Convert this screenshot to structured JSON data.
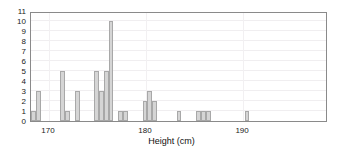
{
  "chart_data": {
    "type": "bar",
    "title": "",
    "subtitle": "",
    "xlabel": "Height (cm)",
    "ylabel": "",
    "xlim": [
      168.15,
      198.75
    ],
    "ylim": [
      0,
      11
    ],
    "grid": true,
    "legend": null,
    "bin_width": 0.5,
    "y_ticks": [
      0,
      1,
      2,
      3,
      4,
      5,
      6,
      7,
      8,
      9,
      10,
      11
    ],
    "y_tick_labels": [
      "0",
      "1",
      "2",
      "3",
      "4",
      "5",
      "6",
      "7",
      "8",
      "9",
      "10",
      "11"
    ],
    "x_ticks": [
      170,
      180,
      190
    ],
    "x_tick_labels": [
      "170",
      "180",
      "190"
    ],
    "bin_starts": [
      168.15,
      168.65,
      169.15,
      169.65,
      170.15,
      170.65,
      171.15,
      171.65,
      172.15,
      172.65,
      173.15,
      173.65,
      174.15,
      174.65,
      175.15,
      175.65,
      176.15,
      176.65,
      177.15,
      177.65,
      178.15,
      178.65,
      179.15,
      179.65,
      180.15,
      180.65,
      181.15,
      181.65,
      182.15,
      182.65,
      183.15,
      183.65,
      184.15,
      184.65,
      185.15,
      185.65,
      186.15,
      186.65,
      187.15,
      187.65,
      188.15,
      188.65,
      189.15,
      189.65,
      190.15,
      190.65,
      191.15,
      191.65,
      192.15,
      192.65,
      193.15,
      193.65,
      194.15,
      194.65,
      195.15,
      195.65,
      196.15,
      196.65,
      197.15,
      197.65,
      198.15
    ],
    "categories": [
      "168.2",
      "168.7",
      "169.2",
      "169.7",
      "170.2",
      "170.7",
      "171.2",
      "171.7",
      "172.2",
      "172.7",
      "173.2",
      "173.7",
      "174.2",
      "174.7",
      "175.2",
      "175.7",
      "176.2",
      "176.7",
      "177.2",
      "177.7",
      "178.2",
      "178.7",
      "179.2",
      "179.7",
      "180.2",
      "180.7",
      "181.2",
      "181.7",
      "182.2",
      "182.7",
      "183.2",
      "183.7",
      "184.2",
      "184.7",
      "185.2",
      "185.7",
      "186.2",
      "186.7",
      "187.2",
      "187.7",
      "188.2",
      "188.7",
      "189.2",
      "189.7",
      "190.2",
      "190.7",
      "191.2",
      "191.7",
      "192.2",
      "192.7",
      "193.2",
      "193.7",
      "194.2",
      "194.7",
      "195.2",
      "195.7",
      "196.2",
      "196.7",
      "197.2",
      "197.7",
      "198.2"
    ],
    "values": [
      1,
      3,
      0,
      0,
      0,
      0,
      5,
      1,
      0,
      3,
      0,
      0,
      0,
      5,
      3,
      5,
      10,
      0,
      1,
      1,
      0,
      0,
      0,
      2,
      3,
      2,
      0,
      0,
      0,
      0,
      1,
      0,
      0,
      0,
      1,
      1,
      1,
      0,
      0,
      0,
      0,
      0,
      0,
      0,
      1,
      0,
      0,
      0,
      0,
      0,
      0,
      0,
      0,
      0,
      0,
      0,
      0,
      0,
      0,
      0,
      0
    ],
    "colors": {
      "bar_fill": "#d5d5d5",
      "bar_edge": "#a8a8a8",
      "frame": "#8a8a8a",
      "grid": "#f0eef0",
      "text": "#1a1a1a",
      "background": "#ffffff"
    }
  }
}
